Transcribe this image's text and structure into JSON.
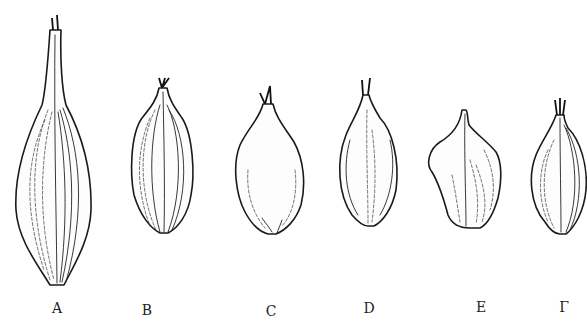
{
  "figure": {
    "type": "botanical line drawing",
    "specimens": [
      {
        "label": "A",
        "label_x": 57,
        "label_y": 300
      },
      {
        "label": "B",
        "label_x": 147,
        "label_y": 302
      },
      {
        "label": "C",
        "label_x": 271,
        "label_y": 303
      },
      {
        "label": "D",
        "label_x": 369,
        "label_y": 300
      },
      {
        "label": "E",
        "label_x": 481,
        "label_y": 299
      },
      {
        "label": "Γ",
        "label_x": 564,
        "label_y": 299
      }
    ],
    "colors": {
      "ink": "#1a1a1a",
      "background": "#ffffff"
    }
  }
}
